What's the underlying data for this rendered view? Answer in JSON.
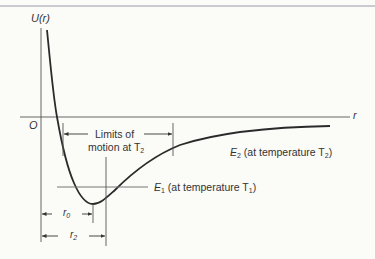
{
  "diagram": {
    "type": "potential-energy-curve",
    "axes": {
      "y_label_main": "U",
      "y_label_arg": "(r)",
      "x_label": "r",
      "origin_label": "O"
    },
    "annotations": {
      "limits_line1": "Limits of",
      "limits_line2": "motion at T",
      "limits_sub": "2",
      "e2_symbol": "E",
      "e2_sub": "2",
      "e2_text": "(at temperature T",
      "e2_tsub": "2",
      "e2_close": ")",
      "e1_symbol": "E",
      "e1_sub": "1",
      "e1_text": "(at temperature T",
      "e1_tsub": "1",
      "e1_close": ")",
      "r0_symbol": "r",
      "r0_sub": "0",
      "r2_symbol": "r",
      "r2_sub": "2"
    },
    "colors": {
      "ink": "#333333",
      "curve": "#2a2a2a",
      "background": "#fbfbf8",
      "e2_accent": "#8a5fc0"
    }
  }
}
